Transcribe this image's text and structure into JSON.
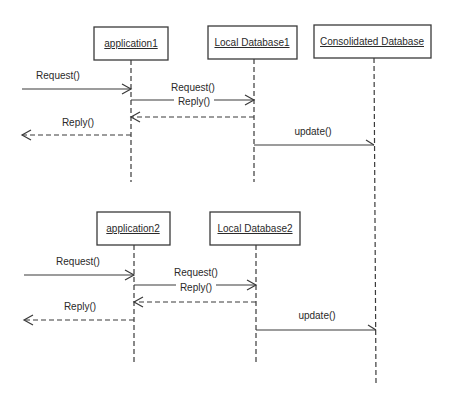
{
  "diagram": {
    "type": "sequence",
    "colors": {
      "stroke": "#3a3a3a",
      "text": "#2a2a2a",
      "background": "#ffffff"
    },
    "groups": [
      {
        "objects": [
          {
            "id": "application1",
            "label": "application1"
          },
          {
            "id": "localdb1",
            "label": "Local Database1"
          },
          {
            "id": "consolidated",
            "label": "Consolidated Database"
          }
        ],
        "messages": [
          {
            "from": "external",
            "to": "application1",
            "label": "Request()",
            "style": "solid"
          },
          {
            "from": "application1",
            "to": "localdb1",
            "label": "Request()",
            "style": "solid"
          },
          {
            "from": "localdb1",
            "to": "application1",
            "label": "Reply()",
            "style": "dashed"
          },
          {
            "from": "application1",
            "to": "external",
            "label": "Reply()",
            "style": "dashed"
          },
          {
            "from": "localdb1",
            "to": "consolidated",
            "label": "update()",
            "style": "solid"
          }
        ]
      },
      {
        "objects": [
          {
            "id": "application2",
            "label": "application2"
          },
          {
            "id": "localdb2",
            "label": "Local Database2"
          }
        ],
        "messages": [
          {
            "from": "external",
            "to": "application2",
            "label": "Request()",
            "style": "solid"
          },
          {
            "from": "application2",
            "to": "localdb2",
            "label": "Request()",
            "style": "solid"
          },
          {
            "from": "localdb2",
            "to": "application2",
            "label": "Reply()",
            "style": "dashed"
          },
          {
            "from": "application2",
            "to": "external",
            "label": "Reply()",
            "style": "dashed"
          },
          {
            "from": "localdb2",
            "to": "consolidated",
            "label": "update()",
            "style": "solid"
          }
        ]
      }
    ]
  }
}
